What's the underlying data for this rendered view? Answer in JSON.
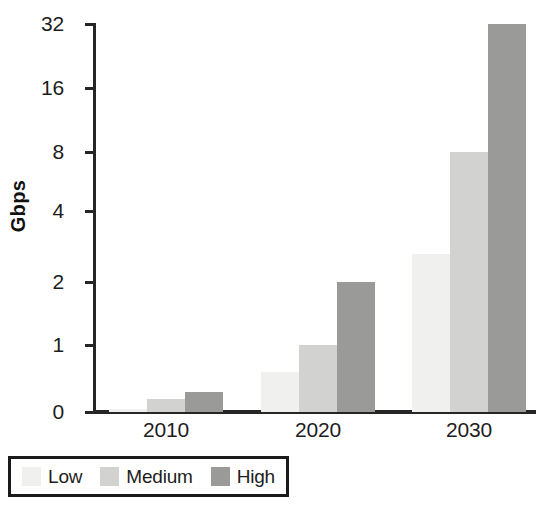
{
  "chart_data": {
    "type": "bar",
    "title": "",
    "xlabel": "",
    "ylabel": "Gbps",
    "categories": [
      "2010",
      "2020",
      "2030"
    ],
    "series": [
      {
        "name": "Low",
        "color": "#f0f0ef",
        "values": [
          0.05,
          0.6,
          2.8
        ]
      },
      {
        "name": "Medium",
        "color": "#d2d2d1",
        "values": [
          0.2,
          1.0,
          8.0
        ]
      },
      {
        "name": "High",
        "color": "#9a9a99",
        "values": [
          0.3,
          2.0,
          32.0
        ]
      }
    ],
    "y_ticks": [
      {
        "label": "0",
        "value": 0
      },
      {
        "label": "1",
        "value": 1
      },
      {
        "label": "2",
        "value": 2
      },
      {
        "label": "4",
        "value": 4
      },
      {
        "label": "8",
        "value": 8
      },
      {
        "label": "16",
        "value": 16
      },
      {
        "label": "32",
        "value": 32
      }
    ],
    "ylim": [
      0,
      32
    ],
    "yscale": "log-like",
    "grid": false,
    "legend_position": "bottom-left",
    "axis_color": "#262626"
  },
  "legend": {
    "items": [
      {
        "label": "Low",
        "color": "#f0f0ef"
      },
      {
        "label": "Medium",
        "color": "#d2d2d1"
      },
      {
        "label": "High",
        "color": "#9a9a99"
      }
    ]
  }
}
